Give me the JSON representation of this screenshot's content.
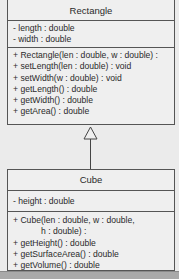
{
  "classes": {
    "rectangle": {
      "name": "Rectangle",
      "attributes": [
        "- length : double",
        "- width : double"
      ],
      "methods": [
        "+ Rectangle(len : double, w : double) :",
        "+ setLength(len : double) : void",
        "+ setWidth(w : double) : void",
        "+ getLength() : double",
        "+ getWidth() : double",
        "+ getArea() : double"
      ]
    },
    "cube": {
      "name": "Cube",
      "attributes": [
        "- height : double"
      ],
      "methods": [
        "+ Cube(len : double, w : double,",
        "h : double) :",
        "+ getHeight() : double",
        "+ getSurfaceArea() : double",
        "+ getVolume() : double"
      ]
    }
  },
  "relationships": [
    {
      "type": "generalization",
      "from": "Cube",
      "to": "Rectangle"
    }
  ]
}
